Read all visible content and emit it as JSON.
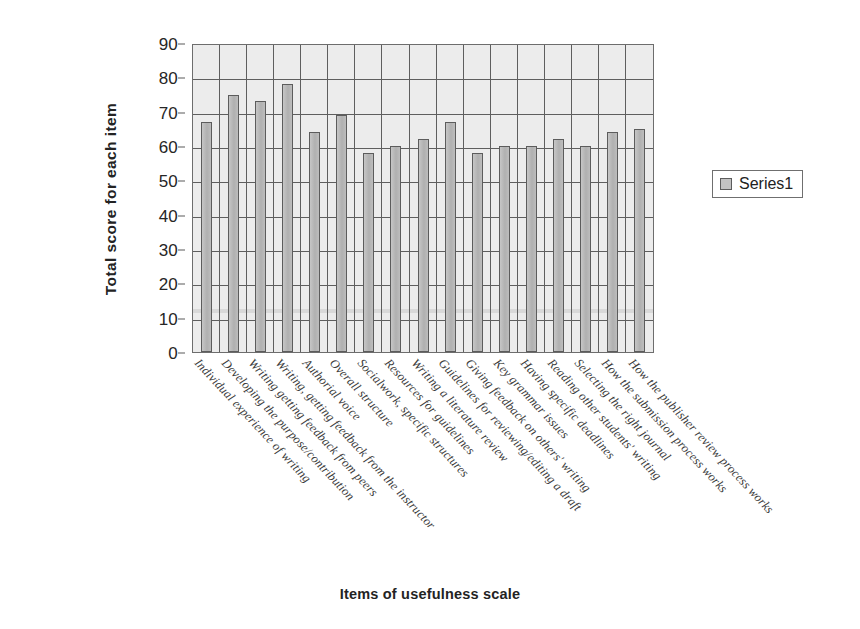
{
  "chart_data": {
    "type": "bar",
    "title": "",
    "xlabel": "Items of usefulness scale",
    "ylabel": "Total score for each item",
    "ylim": [
      0,
      90
    ],
    "ytick_step": 10,
    "yticks": [
      "0",
      "10",
      "20",
      "30",
      "40",
      "50",
      "60",
      "70",
      "80",
      "90"
    ],
    "grid": true,
    "legend_position": "right",
    "legend_entries": [
      "Series1"
    ],
    "categories": [
      "Individual experience of writing",
      "Developing the purpose/contribution",
      "Writing  getting feedback from peers",
      "Writing, getting feedback from the instructor",
      "Authorial voice",
      "Overall structure",
      "Socialwork, specific structures",
      "Resources for guidelines",
      "Writing a literature review",
      "Guidelines for reviewing/editing a draft",
      "Giving feedback on others' writing",
      "Key grammar issues",
      "Having specific deadlines",
      "Reading other students' writing",
      "Selecting the right journal",
      "How the submission process works",
      "How the publisher review process works"
    ],
    "series": [
      {
        "name": "Series1",
        "values": [
          67,
          75,
          73,
          78,
          64,
          69,
          58,
          60,
          62,
          67,
          58,
          60,
          60,
          62,
          60,
          64,
          65
        ]
      }
    ]
  },
  "legend": {
    "swatch_icon": "legend-square-icon",
    "label": "Series1"
  },
  "axis": {
    "y_title": "Total score for each item",
    "x_title": "Items of usefulness scale"
  },
  "colors": {
    "bar_fill": "#b6b6b6",
    "bar_stroke": "#5c5c5c",
    "plot_background": "#ececec",
    "gridline": "#5e5e5e",
    "text": "#232323"
  }
}
